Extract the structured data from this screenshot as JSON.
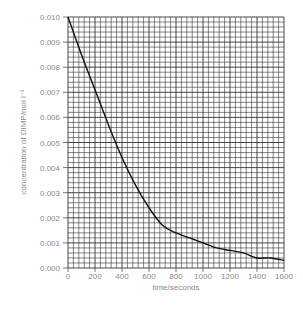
{
  "chart_data": {
    "type": "line",
    "title": "",
    "xlabel": "time/seconds",
    "ylabel": "concentration of DIMP/mol l⁻¹",
    "xlim": [
      0,
      1600
    ],
    "ylim": [
      0.0,
      0.01
    ],
    "grid": true,
    "legend": null,
    "x_ticks": [
      "0",
      "200",
      "400",
      "600",
      "800",
      "1000",
      "1200",
      "1400",
      "1600"
    ],
    "y_ticks": [
      "0.000",
      "0.001",
      "0.002",
      "0.003",
      "0.004",
      "0.005",
      "0.006",
      "0.007",
      "0.008",
      "0.009",
      "0.010"
    ],
    "series": [
      {
        "name": "DIMP concentration",
        "x": [
          0,
          100,
          200,
          300,
          400,
          500,
          600,
          700,
          800,
          900,
          1000,
          1100,
          1200,
          1300,
          1400,
          1500,
          1600
        ],
        "values": [
          0.01,
          0.0085,
          0.0071,
          0.0057,
          0.0044,
          0.0033,
          0.0024,
          0.0017,
          0.0014,
          0.0012,
          0.001,
          0.0008,
          0.0007,
          0.0006,
          0.0004,
          0.0004,
          0.0003
        ]
      }
    ]
  },
  "colors": {
    "grid": "#333333",
    "curve": "#111111",
    "text": "#8a8a8a"
  }
}
